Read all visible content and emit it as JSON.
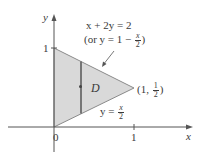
{
  "figure": {
    "axes": {
      "x_label": "x",
      "y_label": "y",
      "origin_label": "0",
      "x_tick_label": "1",
      "y_tick_label": "1"
    },
    "region": {
      "label": "D",
      "fill_color": "#d9d9d9",
      "edge_color": "#8a8a8a"
    },
    "upper_boundary": {
      "equation": "x + 2y = 2",
      "alt_prefix": "(or y = 1 − ",
      "alt_frac_num": "x",
      "alt_frac_den": "2",
      "alt_suffix": ")"
    },
    "lower_boundary": {
      "prefix": "y = ",
      "frac_num": "x",
      "frac_den": "2"
    },
    "vertex_point": {
      "prefix": "(1, ",
      "frac_num": "1",
      "frac_den": "2",
      "suffix": ")"
    }
  }
}
